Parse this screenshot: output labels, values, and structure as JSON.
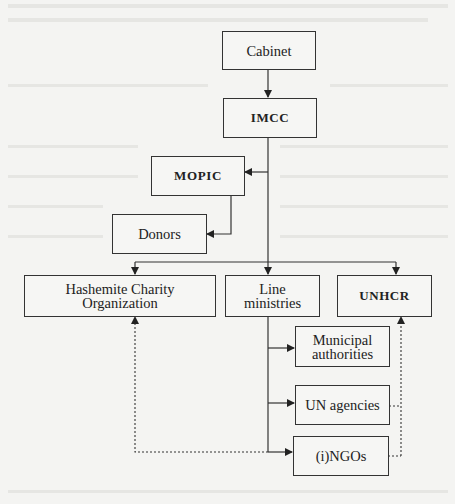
{
  "diagram": {
    "title": "",
    "nodes": [
      {
        "id": "cabinet",
        "label": "Cabinet"
      },
      {
        "id": "imcc",
        "label": "IMCC"
      },
      {
        "id": "mopic",
        "label": "MOPIC"
      },
      {
        "id": "donors",
        "label": "Donors"
      },
      {
        "id": "hco",
        "label": "Hashemite Charity Organization",
        "line1": "Hashemite Charity",
        "line2": "Organization"
      },
      {
        "id": "line_ministries",
        "label": "Line ministries",
        "line1": "Line",
        "line2": "ministries"
      },
      {
        "id": "unhcr",
        "label": "UNHCR"
      },
      {
        "id": "municipal",
        "label": "Municipal authorities",
        "line1": "Municipal",
        "line2": "authorities"
      },
      {
        "id": "un_agencies",
        "label": "UN agencies"
      },
      {
        "id": "ingos",
        "label": "(i)NGOs"
      }
    ],
    "edges": [
      {
        "from": "cabinet",
        "to": "imcc",
        "style": "solid"
      },
      {
        "from": "imcc",
        "to": "mopic",
        "style": "solid"
      },
      {
        "from": "mopic",
        "to": "donors",
        "style": "solid"
      },
      {
        "from": "imcc",
        "to": "hco",
        "style": "solid"
      },
      {
        "from": "imcc",
        "to": "line_ministries",
        "style": "solid"
      },
      {
        "from": "imcc",
        "to": "unhcr",
        "style": "solid"
      },
      {
        "from": "line_ministries",
        "to": "municipal",
        "style": "solid"
      },
      {
        "from": "line_ministries",
        "to": "un_agencies",
        "style": "solid"
      },
      {
        "from": "line_ministries",
        "to": "ingos",
        "style": "solid"
      },
      {
        "from": "ingos",
        "to": "hco",
        "style": "dotted"
      },
      {
        "from": "un_agencies",
        "to": "unhcr",
        "style": "dotted"
      },
      {
        "from": "ingos",
        "to": "unhcr",
        "style": "dotted"
      }
    ],
    "colors": {
      "line": "#333333",
      "background": "#f4f4f2"
    }
  }
}
